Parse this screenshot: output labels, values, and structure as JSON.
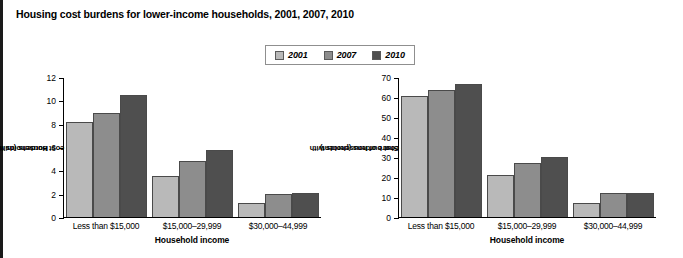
{
  "figure": {
    "title": "Housing cost burdens for lower-income households, 2001, 2007, 2010"
  },
  "legend": {
    "position": "top-center",
    "items": [
      {
        "label": "2001",
        "color": "#b9b9b9"
      },
      {
        "label": "2007",
        "color": "#8d8d8d"
      },
      {
        "label": "2010",
        "color": "#4f4f4f"
      }
    ]
  },
  "chart_data": [
    {
      "type": "bar",
      "title": "Housing cost burdens for lower-income households, 2001, 2007, 2010",
      "panel": "left",
      "categories": [
        "Less than $15,000",
        "$15,000–29,999",
        "$30,000–44,999"
      ],
      "series": [
        {
          "name": "2001",
          "color": "#b9b9b9",
          "values": [
            8.2,
            3.5,
            1.25
          ]
        },
        {
          "name": "2007",
          "color": "#8d8d8d",
          "values": [
            9.0,
            4.8,
            2.0
          ]
        },
        {
          "name": "2010",
          "color": "#4f4f4f",
          "values": [
            10.5,
            5.8,
            2.1
          ]
        }
      ],
      "xlabel": "Household income",
      "ylabel": "Households with severe cost burdens (millions)",
      "ylabel_line1": "Households with",
      "ylabel_line2": "severe cost burdens (millions)",
      "ylim": [
        0,
        12
      ],
      "yticks": [
        0,
        2,
        4,
        6,
        8,
        10,
        12
      ],
      "grid": false
    },
    {
      "type": "bar",
      "panel": "right",
      "categories": [
        "Less than $15,000",
        "$15,000–29,999",
        "$30,000–44,999"
      ],
      "series": [
        {
          "name": "2001",
          "color": "#b9b9b9",
          "values": [
            61,
            21,
            7
          ]
        },
        {
          "name": "2007",
          "color": "#8d8d8d",
          "values": [
            64,
            27,
            12
          ]
        },
        {
          "name": "2010",
          "color": "#4f4f4f",
          "values": [
            67,
            30,
            12
          ]
        }
      ],
      "xlabel": "Household income",
      "ylabel": "Share of households with severe cost burdens (percent)",
      "ylabel_line1": "Share of households with",
      "ylabel_line2": "severe cost burdens (percent)",
      "ylim": [
        0,
        70
      ],
      "yticks": [
        0,
        10,
        20,
        30,
        40,
        50,
        60,
        70
      ],
      "grid": false
    }
  ]
}
